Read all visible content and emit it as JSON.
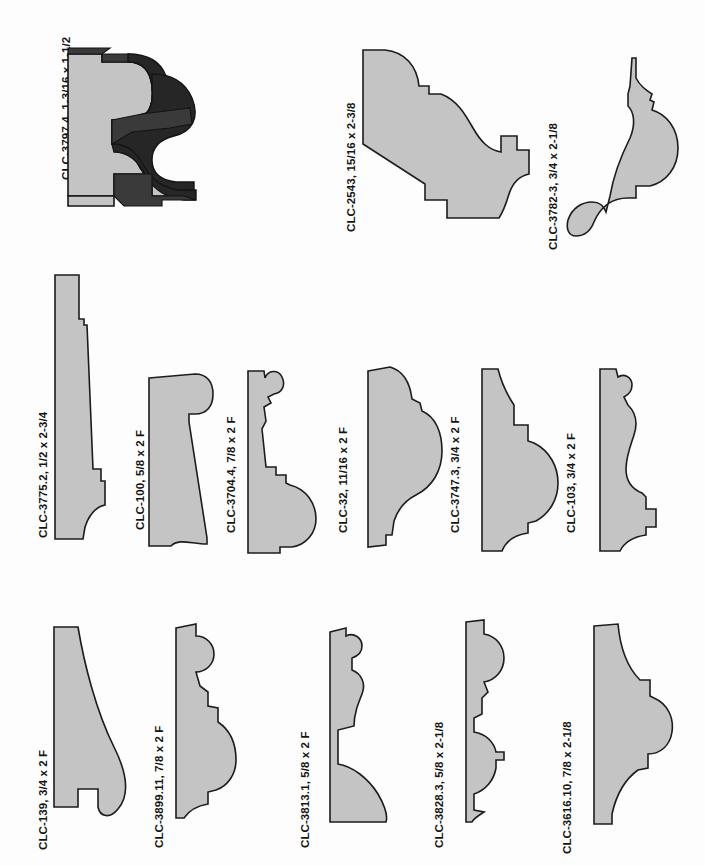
{
  "page": {
    "background_color": "#fdfdfd",
    "profile_fill_color": "#c4c4c4",
    "profile_outline_color": "#1c1c1c",
    "shadow_color": "#262626",
    "rows": 3,
    "profile_count": 14
  },
  "profiles": [
    {
      "id": "CLC-3797.4",
      "dimensions": "1-3/16 x 1-1/2",
      "label": "CLC-3797.4, 1-3/16 x 1-1/2",
      "render": "3d-shaded",
      "row": 1,
      "column": 1
    },
    {
      "id": "CLC-2543",
      "dimensions": "15/16 x 2-3/8",
      "label": "CLC-2543,  15/16 x 2-3/8",
      "render": "flat-section",
      "row": 1,
      "column": 2
    },
    {
      "id": "CLC-3782-3",
      "dimensions": "3/4 x 2-1/8",
      "label": "CLC-3782-3,  3/4 x 2-1/8",
      "render": "flat-section",
      "row": 1,
      "column": 3
    },
    {
      "id": "CLC-3775.2",
      "dimensions": "1/2 x 2-3/4",
      "label": "CLC-3775.2,  1/2 x 2-3/4",
      "render": "flat-section",
      "row": 2,
      "column": 1
    },
    {
      "id": "CLC-100",
      "dimensions": "5/8 x 2 F",
      "label": "CLC-100,  5/8 x 2 F",
      "render": "flat-section",
      "row": 2,
      "column": 2
    },
    {
      "id": "CLC-3704.4",
      "dimensions": "7/8 x 2 F",
      "label": "CLC-3704.4,  7/8 x 2 F",
      "render": "flat-section",
      "row": 2,
      "column": 3
    },
    {
      "id": "CLC-32",
      "dimensions": "11/16 x 2 F",
      "label": "CLC-32,  11/16 x 2 F",
      "render": "flat-section",
      "row": 2,
      "column": 4
    },
    {
      "id": "CLC-3747.3",
      "dimensions": "3/4 x 2 F",
      "label": "CLC-3747.3,  3/4 x 2 F",
      "render": "flat-section",
      "row": 2,
      "column": 5
    },
    {
      "id": "CLC-103",
      "dimensions": "3/4 x 2 F",
      "label": "CLC-103,  3/4 x 2 F",
      "render": "flat-section",
      "row": 2,
      "column": 6
    },
    {
      "id": "CLC-139",
      "dimensions": "3/4 x 2 F",
      "label": "CLC-139,  3/4 x 2 F",
      "render": "flat-section",
      "row": 3,
      "column": 1
    },
    {
      "id": "CLC-3899.11",
      "dimensions": "7/8 x 2 F",
      "label": "CLC-3899.11,  7/8 x 2 F",
      "render": "flat-section",
      "row": 3,
      "column": 2
    },
    {
      "id": "CLC-3813.1",
      "dimensions": "5/8 x 2 F",
      "label": "CLC-3813.1,  5/8 x 2 F",
      "render": "flat-section",
      "row": 3,
      "column": 3
    },
    {
      "id": "CLC-3828.3",
      "dimensions": "5/8 x 2-1/8",
      "label": "CLC-3828.3,  5/8 x 2-1/8",
      "render": "flat-section",
      "row": 3,
      "column": 4
    },
    {
      "id": "CLC-3616.10",
      "dimensions": "7/8 x 2-1/8",
      "label": "CLC-3616.10,  7/8 x 2-1/8",
      "render": "flat-section",
      "row": 3,
      "column": 5
    }
  ]
}
